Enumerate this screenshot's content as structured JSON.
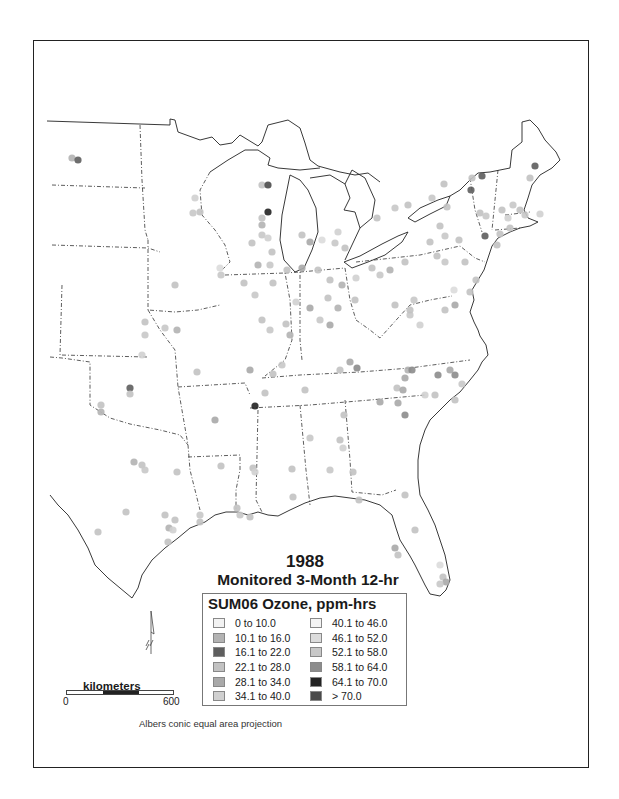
{
  "title": {
    "year": "1988",
    "subtitle": "Monitored 3-Month 12-hr"
  },
  "legend": {
    "title": "SUM06 Ozone, ppm-hrs",
    "column1": [
      {
        "label": "0  to 10.0",
        "color": "#f2f2f2"
      },
      {
        "label": "10.1  to 16.0",
        "color": "#b3b3b3"
      },
      {
        "label": "16.1  to 22.0",
        "color": "#5e5e5e"
      },
      {
        "label": "22.1  to 28.0",
        "color": "#c2c2c2"
      },
      {
        "label": "28.1  to 34.0",
        "color": "#a9a9a9"
      },
      {
        "label": "34.1  to 40.0",
        "color": "#d0d0d0"
      }
    ],
    "column2": [
      {
        "label": "40.1 to 46.0",
        "color": "#f4f4f4"
      },
      {
        "label": "46.1 to 52.0",
        "color": "#dcdcdc"
      },
      {
        "label": "52.1 to 58.0",
        "color": "#c8c8c8"
      },
      {
        "label": "58.1 to 64.0",
        "color": "#8c8c8c"
      },
      {
        "label": "64.1 to 70.0",
        "color": "#222222"
      },
      {
        "label": "> 70.0",
        "color": "#4a4a4a"
      }
    ]
  },
  "scale_bar": {
    "unit_label": "kilometers",
    "min_label": "0",
    "max_label": "600"
  },
  "projection_note": "Albers conic equal area projection",
  "icons": {
    "north_arrow": "north-arrow-icon"
  },
  "map_layers": {
    "basemap": "Eastern United States state boundaries",
    "point_layer": "Ozone monitoring sites (SUM06)"
  },
  "monitor_sites": [
    {
      "x": 72,
      "y": 158,
      "c": "#b3b3b3"
    },
    {
      "x": 78,
      "y": 160,
      "c": "#5e5e5e"
    },
    {
      "x": 262,
      "y": 185,
      "c": "#c2c2c2"
    },
    {
      "x": 268,
      "y": 185,
      "c": "#4a4a4a"
    },
    {
      "x": 195,
      "y": 198,
      "c": "#d0d0d0"
    },
    {
      "x": 200,
      "y": 212,
      "c": "#c2c2c2"
    },
    {
      "x": 193,
      "y": 213,
      "c": "#c8c8c8"
    },
    {
      "x": 268,
      "y": 212,
      "c": "#222222"
    },
    {
      "x": 262,
      "y": 218,
      "c": "#c2c2c2"
    },
    {
      "x": 262,
      "y": 225,
      "c": "#b3b3b3"
    },
    {
      "x": 262,
      "y": 235,
      "c": "#c8c8c8"
    },
    {
      "x": 252,
      "y": 243,
      "c": "#c2c2c2"
    },
    {
      "x": 268,
      "y": 238,
      "c": "#d0d0d0"
    },
    {
      "x": 272,
      "y": 252,
      "c": "#c2c2c2"
    },
    {
      "x": 258,
      "y": 265,
      "c": "#b3b3b3"
    },
    {
      "x": 270,
      "y": 265,
      "c": "#c8c8c8"
    },
    {
      "x": 302,
      "y": 235,
      "c": "#c2c2c2"
    },
    {
      "x": 310,
      "y": 242,
      "c": "#a9a9a9"
    },
    {
      "x": 322,
      "y": 240,
      "c": "#dcdcdc"
    },
    {
      "x": 335,
      "y": 243,
      "c": "#c8c8c8"
    },
    {
      "x": 338,
      "y": 232,
      "c": "#d0d0d0"
    },
    {
      "x": 345,
      "y": 248,
      "c": "#c2c2c2"
    },
    {
      "x": 220,
      "y": 268,
      "c": "#dcdcdc"
    },
    {
      "x": 221,
      "y": 275,
      "c": "#c8c8c8"
    },
    {
      "x": 287,
      "y": 270,
      "c": "#c2c2c2"
    },
    {
      "x": 302,
      "y": 268,
      "c": "#a9a9a9"
    },
    {
      "x": 318,
      "y": 270,
      "c": "#c2c2c2"
    },
    {
      "x": 330,
      "y": 280,
      "c": "#c2c2c2"
    },
    {
      "x": 342,
      "y": 285,
      "c": "#b3b3b3"
    },
    {
      "x": 356,
      "y": 278,
      "c": "#d0d0d0"
    },
    {
      "x": 372,
      "y": 268,
      "c": "#c2c2c2"
    },
    {
      "x": 380,
      "y": 275,
      "c": "#c8c8c8"
    },
    {
      "x": 390,
      "y": 270,
      "c": "#b3b3b3"
    },
    {
      "x": 405,
      "y": 262,
      "c": "#c2c2c2"
    },
    {
      "x": 244,
      "y": 283,
      "c": "#c2c2c2"
    },
    {
      "x": 255,
      "y": 295,
      "c": "#c8c8c8"
    },
    {
      "x": 273,
      "y": 283,
      "c": "#c2c2c2"
    },
    {
      "x": 296,
      "y": 302,
      "c": "#d0d0d0"
    },
    {
      "x": 310,
      "y": 308,
      "c": "#a9a9a9"
    },
    {
      "x": 328,
      "y": 298,
      "c": "#c2c2c2"
    },
    {
      "x": 338,
      "y": 308,
      "c": "#b3b3b3"
    },
    {
      "x": 355,
      "y": 300,
      "c": "#c2c2c2"
    },
    {
      "x": 320,
      "y": 320,
      "c": "#c8c8c8"
    },
    {
      "x": 330,
      "y": 325,
      "c": "#a9a9a9"
    },
    {
      "x": 262,
      "y": 320,
      "c": "#c2c2c2"
    },
    {
      "x": 270,
      "y": 330,
      "c": "#c8c8c8"
    },
    {
      "x": 286,
      "y": 324,
      "c": "#c2c2c2"
    },
    {
      "x": 290,
      "y": 335,
      "c": "#b3b3b3"
    },
    {
      "x": 395,
      "y": 305,
      "c": "#c2c2c2"
    },
    {
      "x": 410,
      "y": 315,
      "c": "#c8c8c8"
    },
    {
      "x": 420,
      "y": 325,
      "c": "#d0d0d0"
    },
    {
      "x": 445,
      "y": 310,
      "c": "#c2c2c2"
    },
    {
      "x": 455,
      "y": 305,
      "c": "#a9a9a9"
    },
    {
      "x": 470,
      "y": 292,
      "c": "#c2c2c2"
    },
    {
      "x": 175,
      "y": 285,
      "c": "#c2c2c2"
    },
    {
      "x": 165,
      "y": 328,
      "c": "#c8c8c8"
    },
    {
      "x": 177,
      "y": 330,
      "c": "#b3b3b3"
    },
    {
      "x": 145,
      "y": 322,
      "c": "#c2c2c2"
    },
    {
      "x": 145,
      "y": 335,
      "c": "#c8c8c8"
    },
    {
      "x": 197,
      "y": 372,
      "c": "#c2c2c2"
    },
    {
      "x": 142,
      "y": 355,
      "c": "#d0d0d0"
    },
    {
      "x": 250,
      "y": 370,
      "c": "#a9a9a9"
    },
    {
      "x": 273,
      "y": 374,
      "c": "#c2c2c2"
    },
    {
      "x": 282,
      "y": 365,
      "c": "#c8c8c8"
    },
    {
      "x": 305,
      "y": 390,
      "c": "#c2c2c2"
    },
    {
      "x": 340,
      "y": 370,
      "c": "#c2c2c2"
    },
    {
      "x": 350,
      "y": 362,
      "c": "#a9a9a9"
    },
    {
      "x": 357,
      "y": 368,
      "c": "#8c8c8c"
    },
    {
      "x": 408,
      "y": 370,
      "c": "#b3b3b3"
    },
    {
      "x": 412,
      "y": 370,
      "c": "#8c8c8c"
    },
    {
      "x": 438,
      "y": 375,
      "c": "#8c8c8c"
    },
    {
      "x": 450,
      "y": 370,
      "c": "#a9a9a9"
    },
    {
      "x": 455,
      "y": 375,
      "c": "#8c8c8c"
    },
    {
      "x": 462,
      "y": 384,
      "c": "#c8c8c8"
    },
    {
      "x": 405,
      "y": 378,
      "c": "#a9a9a9"
    },
    {
      "x": 397,
      "y": 388,
      "c": "#c2c2c2"
    },
    {
      "x": 403,
      "y": 390,
      "c": "#a9a9a9"
    },
    {
      "x": 425,
      "y": 395,
      "c": "#d0d0d0"
    },
    {
      "x": 380,
      "y": 402,
      "c": "#a9a9a9"
    },
    {
      "x": 398,
      "y": 403,
      "c": "#a9a9a9"
    },
    {
      "x": 405,
      "y": 415,
      "c": "#8c8c8c"
    },
    {
      "x": 435,
      "y": 395,
      "c": "#c2c2c2"
    },
    {
      "x": 455,
      "y": 400,
      "c": "#c2c2c2"
    },
    {
      "x": 130,
      "y": 388,
      "c": "#5e5e5e"
    },
    {
      "x": 130,
      "y": 394,
      "c": "#c2c2c2"
    },
    {
      "x": 101,
      "y": 405,
      "c": "#c2c2c2"
    },
    {
      "x": 101,
      "y": 412,
      "c": "#b3b3b3"
    },
    {
      "x": 215,
      "y": 420,
      "c": "#a9a9a9"
    },
    {
      "x": 255,
      "y": 406,
      "c": "#222222"
    },
    {
      "x": 265,
      "y": 393,
      "c": "#c2c2c2"
    },
    {
      "x": 310,
      "y": 438,
      "c": "#c8c8c8"
    },
    {
      "x": 344,
      "y": 415,
      "c": "#c2c2c2"
    },
    {
      "x": 340,
      "y": 440,
      "c": "#c2c2c2"
    },
    {
      "x": 343,
      "y": 448,
      "c": "#d0d0d0"
    },
    {
      "x": 353,
      "y": 472,
      "c": "#c2c2c2"
    },
    {
      "x": 330,
      "y": 470,
      "c": "#c8c8c8"
    },
    {
      "x": 134,
      "y": 462,
      "c": "#b3b3b3"
    },
    {
      "x": 142,
      "y": 465,
      "c": "#c2c2c2"
    },
    {
      "x": 145,
      "y": 470,
      "c": "#c8c8c8"
    },
    {
      "x": 177,
      "y": 472,
      "c": "#c2c2c2"
    },
    {
      "x": 221,
      "y": 466,
      "c": "#c2c2c2"
    },
    {
      "x": 253,
      "y": 468,
      "c": "#c2c2c2"
    },
    {
      "x": 255,
      "y": 472,
      "c": "#d0d0d0"
    },
    {
      "x": 292,
      "y": 469,
      "c": "#c2c2c2"
    },
    {
      "x": 126,
      "y": 512,
      "c": "#c2c2c2"
    },
    {
      "x": 98,
      "y": 532,
      "c": "#c2c2c2"
    },
    {
      "x": 165,
      "y": 515,
      "c": "#c2c2c2"
    },
    {
      "x": 175,
      "y": 520,
      "c": "#c2c2c2"
    },
    {
      "x": 169,
      "y": 528,
      "c": "#b3b3b3"
    },
    {
      "x": 173,
      "y": 530,
      "c": "#d0d0d0"
    },
    {
      "x": 200,
      "y": 515,
      "c": "#c8c8c8"
    },
    {
      "x": 200,
      "y": 522,
      "c": "#c2c2c2"
    },
    {
      "x": 237,
      "y": 508,
      "c": "#c2c2c2"
    },
    {
      "x": 240,
      "y": 515,
      "c": "#c8c8c8"
    },
    {
      "x": 250,
      "y": 517,
      "c": "#c2c2c2"
    },
    {
      "x": 293,
      "y": 497,
      "c": "#c2c2c2"
    },
    {
      "x": 359,
      "y": 500,
      "c": "#c2c2c2"
    },
    {
      "x": 168,
      "y": 542,
      "c": "#c2c2c2"
    },
    {
      "x": 405,
      "y": 495,
      "c": "#c2c2c2"
    },
    {
      "x": 415,
      "y": 530,
      "c": "#c2c2c2"
    },
    {
      "x": 395,
      "y": 548,
      "c": "#a9a9a9"
    },
    {
      "x": 398,
      "y": 555,
      "c": "#c2c2c2"
    },
    {
      "x": 440,
      "y": 565,
      "c": "#dcdcdc"
    },
    {
      "x": 443,
      "y": 577,
      "c": "#c2c2c2"
    },
    {
      "x": 446,
      "y": 582,
      "c": "#a9a9a9"
    },
    {
      "x": 440,
      "y": 584,
      "c": "#c8c8c8"
    },
    {
      "x": 472,
      "y": 178,
      "c": "#c2c2c2"
    },
    {
      "x": 482,
      "y": 176,
      "c": "#5e5e5e"
    },
    {
      "x": 471,
      "y": 190,
      "c": "#5e5e5e"
    },
    {
      "x": 444,
      "y": 184,
      "c": "#c2c2c2"
    },
    {
      "x": 432,
      "y": 198,
      "c": "#c8c8c8"
    },
    {
      "x": 447,
      "y": 207,
      "c": "#c2c2c2"
    },
    {
      "x": 480,
      "y": 213,
      "c": "#c2c2c2"
    },
    {
      "x": 486,
      "y": 216,
      "c": "#c8c8c8"
    },
    {
      "x": 440,
      "y": 226,
      "c": "#c2c2c2"
    },
    {
      "x": 430,
      "y": 242,
      "c": "#c2c2c2"
    },
    {
      "x": 445,
      "y": 236,
      "c": "#c8c8c8"
    },
    {
      "x": 459,
      "y": 240,
      "c": "#c2c2c2"
    },
    {
      "x": 485,
      "y": 236,
      "c": "#5e5e5e"
    },
    {
      "x": 497,
      "y": 245,
      "c": "#c2c2c2"
    },
    {
      "x": 502,
      "y": 210,
      "c": "#c2c2c2"
    },
    {
      "x": 508,
      "y": 218,
      "c": "#d0d0d0"
    },
    {
      "x": 513,
      "y": 205,
      "c": "#c8c8c8"
    },
    {
      "x": 520,
      "y": 210,
      "c": "#c2c2c2"
    },
    {
      "x": 525,
      "y": 215,
      "c": "#c8c8c8"
    },
    {
      "x": 540,
      "y": 214,
      "c": "#d0d0d0"
    },
    {
      "x": 535,
      "y": 166,
      "c": "#5e5e5e"
    },
    {
      "x": 530,
      "y": 178,
      "c": "#c2c2c2"
    },
    {
      "x": 500,
      "y": 234,
      "c": "#c2c2c2"
    },
    {
      "x": 510,
      "y": 228,
      "c": "#c2c2c2"
    },
    {
      "x": 377,
      "y": 218,
      "c": "#c2c2c2"
    },
    {
      "x": 395,
      "y": 208,
      "c": "#c8c8c8"
    },
    {
      "x": 408,
      "y": 205,
      "c": "#c2c2c2"
    },
    {
      "x": 437,
      "y": 256,
      "c": "#c2c2c2"
    },
    {
      "x": 445,
      "y": 262,
      "c": "#c8c8c8"
    },
    {
      "x": 465,
      "y": 262,
      "c": "#c2c2c2"
    },
    {
      "x": 476,
      "y": 280,
      "c": "#c2c2c2"
    },
    {
      "x": 454,
      "y": 290,
      "c": "#dcdcdc"
    },
    {
      "x": 414,
      "y": 300,
      "c": "#c8c8c8"
    },
    {
      "x": 410,
      "y": 310,
      "c": "#c2c2c2"
    }
  ]
}
